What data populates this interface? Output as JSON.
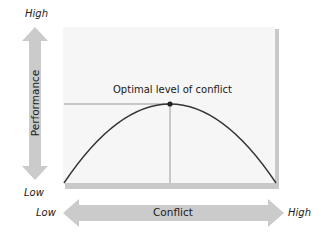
{
  "diagram": {
    "title": "Optimal level of conflict",
    "y_axis": {
      "label": "Performance",
      "high": "High",
      "low": "Low"
    },
    "x_axis": {
      "label": "Conflict",
      "high": "High",
      "low": "Low"
    },
    "colors": {
      "arrow": "#cbcbcb",
      "panel": "#f6f6f6",
      "panel_bevel": "#c9c9c9",
      "curve": "#333333",
      "guide": "#999999",
      "dot": "#222222"
    }
  }
}
